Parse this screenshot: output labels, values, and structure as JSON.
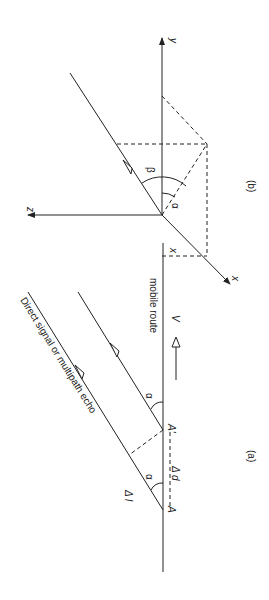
{
  "figure_a": {
    "caption": "(a)",
    "signal_label": "Direct signal or multipath echo",
    "route_label": "mobile route",
    "axis_x": "x",
    "velocity": "V",
    "point_a": "A",
    "point_a_prime": "A'",
    "delta_d": "Δ d",
    "delta_l": "Δ l",
    "angle": "α"
  },
  "figure_b": {
    "caption": "(b)",
    "axis_x": "x",
    "axis_y": "y",
    "axis_z": "z",
    "angle_alpha": "α",
    "angle_beta": "β"
  }
}
